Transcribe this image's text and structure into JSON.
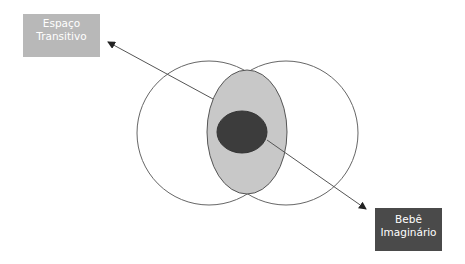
{
  "diagram": {
    "type": "venn-with-annotations",
    "labels": {
      "transitional_space": {
        "line1": "Espaço",
        "line2": "Transitivo"
      },
      "imaginary_baby": {
        "line1": "Bebê",
        "line2": "Imaginário"
      }
    },
    "colors": {
      "outline": "#666666",
      "intersection_fill": "#c8c8c8",
      "core_fill": "#3c3c3c",
      "transitional_box": "#b8b8b8",
      "imaginary_box": "#4a4a4a",
      "label_text": "#ffffff",
      "background": "#ffffff"
    },
    "shapes": {
      "left_circle": {
        "cx": 209,
        "cy": 133,
        "r": 72
      },
      "right_circle": {
        "cx": 286,
        "cy": 133,
        "r": 72
      },
      "intersection_ellipse": {
        "cx": 247,
        "cy": 132,
        "rx": 40,
        "ry": 62
      },
      "core_ellipse": {
        "cx": 242,
        "cy": 132,
        "rx": 25,
        "ry": 21
      }
    },
    "arrows": [
      {
        "from": [
          213,
          99
        ],
        "to": [
          108,
          42
        ],
        "target": "transitional_space"
      },
      {
        "from": [
          267,
          140
        ],
        "to": [
          366,
          209
        ],
        "target": "imaginary_baby"
      }
    ]
  }
}
